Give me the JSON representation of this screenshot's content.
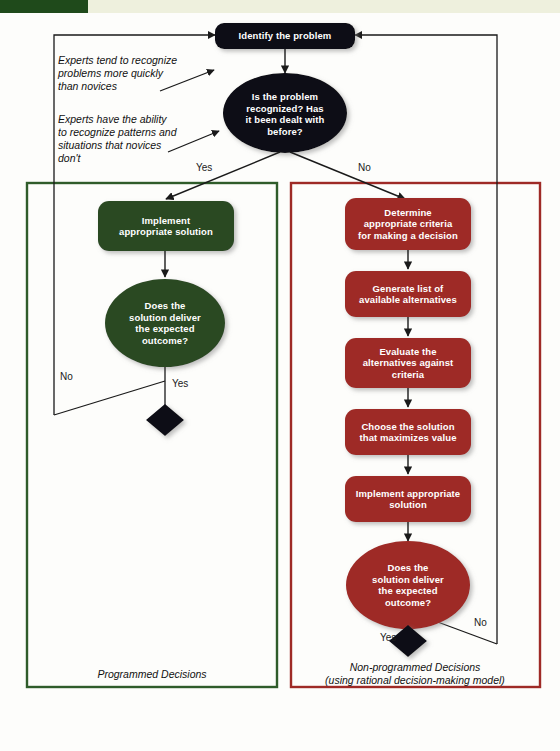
{
  "header": {
    "strip_text": "",
    "tab_color": "#1f4a1b",
    "band_color": "#eef0dd"
  },
  "colors": {
    "start_node": "#0d0d14",
    "decision_node": "#0d0d14",
    "green_node": "#2c4a24",
    "red_node": "#9e2a26",
    "green_frame": "#2f5c2a",
    "red_frame": "#9e2a26",
    "connector": "#1a1a1a",
    "node_text": "#ffffff",
    "page_bg": "#fdfdfb"
  },
  "nodes": {
    "start": {
      "id": "identify-the-problem",
      "label": "Identify the problem",
      "shape": "rounded-rect",
      "fill": "#0d0d14"
    },
    "main_decision": {
      "id": "is-problem-recognized",
      "label": "Is the problem recognized? Has it been dealt with before?",
      "lines": [
        "Is the problem",
        "recognized? Has",
        "it been dealt with",
        "before?"
      ],
      "shape": "ellipse",
      "fill": "#0d0d14"
    },
    "green": [
      {
        "id": "implement-appropriate-solution-green",
        "label": "Implement appropriate solution",
        "lines": [
          "Implement",
          "appropriate solution"
        ],
        "shape": "rounded-rect",
        "fill": "#2c4a24"
      },
      {
        "id": "does-solution-deliver-green",
        "label": "Does the solution deliver the expected outcome?",
        "lines": [
          "Does the",
          "solution deliver",
          "the expected",
          "outcome?"
        ],
        "shape": "ellipse",
        "fill": "#2c4a24"
      }
    ],
    "red": [
      {
        "id": "determine-criteria",
        "label": "Determine appropriate criteria for making a decision",
        "lines": [
          "Determine",
          "appropriate criteria",
          "for making a decision"
        ],
        "shape": "rounded-rect",
        "fill": "#9e2a26"
      },
      {
        "id": "generate-alternatives",
        "label": "Generate list of available alternatives",
        "lines": [
          "Generate list of",
          "available alternatives"
        ],
        "shape": "rounded-rect",
        "fill": "#9e2a26"
      },
      {
        "id": "evaluate-alternatives",
        "label": "Evaluate the alternatives against criteria",
        "lines": [
          "Evaluate the",
          "alternatives against",
          "criteria"
        ],
        "shape": "rounded-rect",
        "fill": "#9e2a26"
      },
      {
        "id": "choose-solution",
        "label": "Choose the solution that maximizes value",
        "lines": [
          "Choose the solution",
          "that maximizes value"
        ],
        "shape": "rounded-rect",
        "fill": "#9e2a26"
      },
      {
        "id": "implement-appropriate-solution-red",
        "label": "Implement appropriate solution",
        "lines": [
          "Implement appropriate",
          "solution"
        ],
        "shape": "rounded-rect",
        "fill": "#9e2a26"
      },
      {
        "id": "does-solution-deliver-red",
        "label": "Does the solution deliver the expected outcome?",
        "lines": [
          "Does the",
          "solution deliver",
          "the expected",
          "outcome?"
        ],
        "shape": "ellipse",
        "fill": "#9e2a26"
      }
    ],
    "terminators": [
      {
        "id": "green-end-diamond",
        "shape": "diamond",
        "fill": "#0d0d14"
      },
      {
        "id": "red-end-diamond",
        "shape": "diamond",
        "fill": "#0d0d14"
      }
    ]
  },
  "edge_labels": {
    "top_yes": "Yes",
    "top_no": "No",
    "green_no": "No",
    "green_yes": "Yes",
    "red_yes": "Yes",
    "red_no": "No"
  },
  "annotations": [
    {
      "id": "experts-recognize-quickly",
      "lines": [
        "Experts tend to recognize",
        "problems more quickly",
        "than novices"
      ]
    },
    {
      "id": "experts-recognize-patterns",
      "lines": [
        "Experts have the ability",
        "to recognize patterns and",
        "situations that novices",
        "don't"
      ]
    }
  ],
  "captions": {
    "left": {
      "lines": [
        "Programmed Decisions"
      ]
    },
    "right": {
      "lines": [
        "Non-programmed Decisions",
        "(using rational decision-making model)"
      ]
    }
  }
}
